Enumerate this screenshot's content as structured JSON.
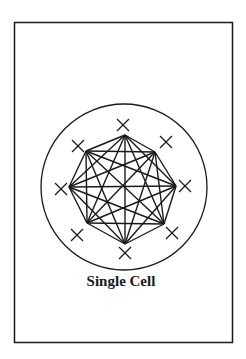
{
  "diagram": {
    "label": "Single Cell",
    "stroke_color": "#1a1a1a",
    "background": "#ffffff",
    "frame": {
      "x": 14.5,
      "y": 22.5,
      "w": 218,
      "h": 320
    },
    "cell_circle": {
      "cx": 124,
      "cy": 187,
      "r": 83
    },
    "nodes": [
      {
        "x": 125,
        "y": 135
      },
      {
        "x": 155,
        "y": 152
      },
      {
        "x": 176,
        "y": 186
      },
      {
        "x": 164,
        "y": 224
      },
      {
        "x": 125,
        "y": 244
      },
      {
        "x": 87,
        "y": 223
      },
      {
        "x": 69,
        "y": 187
      },
      {
        "x": 86,
        "y": 151
      }
    ],
    "x_marks": [
      {
        "x": 123,
        "y": 125
      },
      {
        "x": 166,
        "y": 142
      },
      {
        "x": 185,
        "y": 186
      },
      {
        "x": 172,
        "y": 233
      },
      {
        "x": 125,
        "y": 253
      },
      {
        "x": 77,
        "y": 235
      },
      {
        "x": 61,
        "y": 189
      },
      {
        "x": 78,
        "y": 146
      }
    ],
    "connectivity": "fully-connected"
  }
}
